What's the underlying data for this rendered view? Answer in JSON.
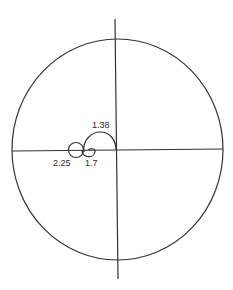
{
  "diagram": {
    "type": "polar-locus-diagram",
    "outer_circle": {
      "cx": 117.5,
      "cy": 149.5,
      "rx": 105.5,
      "ry": 110.5
    },
    "axes": {
      "horizontal": {
        "x1": 12,
        "y1": 151,
        "x2": 223,
        "y2": 149
      },
      "vertical": {
        "x1": 115,
        "y1": 19,
        "x2": 118,
        "y2": 279
      }
    },
    "labels": [
      {
        "id": "label-1-38",
        "text": "1.38",
        "x": 92,
        "y": 128
      },
      {
        "id": "label-2-25",
        "text": "2.25",
        "x": 53,
        "y": 166
      },
      {
        "id": "label-1-7",
        "text": "1.7",
        "x": 85,
        "y": 166
      }
    ],
    "stroke_color": "#333333",
    "background": "#ffffff"
  }
}
